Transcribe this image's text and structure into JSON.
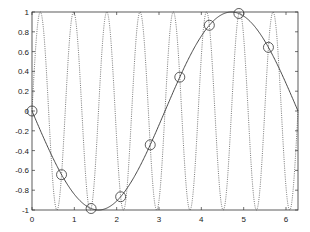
{
  "chart_data": {
    "type": "line",
    "title": "",
    "xlabel": "",
    "ylabel": "",
    "xlim": [
      0,
      6.2832
    ],
    "ylim": [
      -1,
      1
    ],
    "grid": false,
    "legend": null,
    "x_ticks": [
      "0",
      "1",
      "2",
      "3",
      "4",
      "5",
      "6"
    ],
    "y_ticks": [
      "-1",
      "-0.8",
      "-0.6",
      "-0.4",
      "-0.2",
      "0",
      "0.2",
      "0.4",
      "0.6",
      "0.8",
      "1"
    ],
    "series": [
      {
        "name": "solid curve",
        "style": "solid",
        "function": "-sin(x)",
        "color": "#333333"
      },
      {
        "name": "dotted curve",
        "style": "dotted",
        "function": "sin(8x)",
        "color": "#555555"
      },
      {
        "name": "circle markers",
        "style": "markers-circle",
        "x": [
          0,
          0.698,
          1.396,
          2.094,
          2.793,
          3.491,
          4.189,
          4.887,
          5.585
        ],
        "values": [
          0,
          -0.643,
          -0.985,
          -0.866,
          -0.342,
          0.342,
          0.866,
          0.985,
          0.643
        ],
        "color": "#333333"
      }
    ]
  },
  "axes": {
    "left": 32,
    "right": 298,
    "top": 12,
    "bottom": 210,
    "frame_color": "#333333"
  }
}
